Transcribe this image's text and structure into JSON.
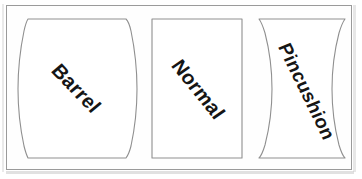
{
  "figure": {
    "background_color": "#ffffff",
    "frame_color": "#9a9a9a",
    "outline_color": "#8f8f8f",
    "text_color": "#151515",
    "width": 362,
    "height": 179
  },
  "panels": [
    {
      "id": "barrel",
      "label": "Barrel",
      "distortion": "barrel",
      "description": "Rectangle with sides bulging convexly outward",
      "rotation_deg": 46,
      "outline_path": "M 28 19 Q 26 22 24 31 Q 18 60 18 89 Q 18 118 24 146 Q 26 154 28 158 L 126 158 Q 129 154 131 146 Q 137 118 137 89 Q 137 60 131 31 Q 129 22 126 19 Z"
    },
    {
      "id": "normal",
      "label": "Normal",
      "distortion": "none",
      "description": "Undistorted plain rectangle",
      "rotation_deg": 51,
      "outline_path": "M 152 19 L 242 19 L 242 158 L 152 158 Z"
    },
    {
      "id": "pincushion",
      "label": "Pincushion",
      "distortion": "pincushion",
      "description": "Rectangle with sides pinched concavely inward",
      "rotation_deg": 64,
      "outline_path": "M 259 19 Q 262 23 265 33 Q 272 60 272 89 Q 272 118 265 145 Q 262 155 259 158 L 345 158 Q 342 155 339 145 Q 332 118 332 89 Q 332 60 339 33 Q 342 23 345 19 Z"
    }
  ]
}
